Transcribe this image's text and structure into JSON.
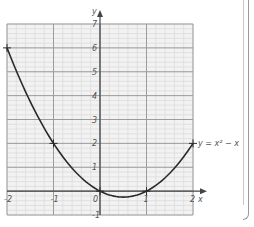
{
  "chart_data": {
    "type": "line",
    "title": "",
    "xlabel": "x",
    "ylabel": "y",
    "equation_label": "y = x² − x",
    "xlim": [
      -2,
      2
    ],
    "ylim": [
      -1,
      7
    ],
    "grid": true,
    "minor_grid_step": 0.2,
    "x_ticks": [
      "-2",
      "-1",
      "0",
      "1",
      "2"
    ],
    "y_ticks": [
      "-1",
      "1",
      "2",
      "3",
      "4",
      "5",
      "6",
      "7"
    ],
    "series": [
      {
        "name": "y = x² − x",
        "x": [
          -2,
          -1,
          0,
          1,
          2
        ],
        "values": [
          6,
          2,
          0,
          0,
          2
        ],
        "marked_points": [
          [
            -2,
            6
          ],
          [
            -1,
            2
          ],
          [
            0,
            0
          ],
          [
            1,
            0
          ],
          [
            2,
            2
          ]
        ]
      }
    ],
    "vertex": [
      0.5,
      -0.25
    ]
  },
  "colors": {
    "grid_minor": "#dcdcdc",
    "grid_major": "#9c9c9c",
    "axis": "#444444",
    "curve": "#2a2a2a",
    "grid_bg": "#f2f2f2"
  }
}
